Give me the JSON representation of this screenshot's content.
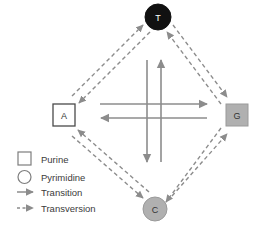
{
  "figure": {
    "background": "#ffffff"
  },
  "nodes": [
    {
      "id": "T",
      "label": "T",
      "shape": "circle",
      "class": "pyrimidine",
      "fill": "#111111",
      "stroke": "#111111",
      "text_color": "#ffffff",
      "position": "top"
    },
    {
      "id": "A",
      "label": "A",
      "shape": "square",
      "class": "purine",
      "fill": "#ffffff",
      "stroke": "#4a4a4a",
      "text_color": "#333333",
      "position": "left"
    },
    {
      "id": "G",
      "label": "G",
      "shape": "square",
      "class": "purine",
      "fill": "#b0b0b0",
      "stroke": "#9a9a9a",
      "text_color": "#333333",
      "position": "right"
    },
    {
      "id": "C",
      "label": "C",
      "shape": "circle",
      "class": "pyrimidine",
      "fill": "#b0b0b0",
      "stroke": "#9a9a9a",
      "text_color": "#333333",
      "position": "bottom"
    }
  ],
  "edges": {
    "transitions": [
      {
        "from": "A",
        "to": "G",
        "style": "solid",
        "orientation": "horizontal"
      },
      {
        "from": "G",
        "to": "A",
        "style": "solid",
        "orientation": "horizontal"
      },
      {
        "from": "T",
        "to": "C",
        "style": "solid",
        "orientation": "vertical"
      },
      {
        "from": "C",
        "to": "T",
        "style": "solid",
        "orientation": "vertical"
      }
    ],
    "transversions": [
      {
        "from": "A",
        "to": "T",
        "style": "dashed"
      },
      {
        "from": "T",
        "to": "A",
        "style": "dashed"
      },
      {
        "from": "T",
        "to": "G",
        "style": "dashed"
      },
      {
        "from": "G",
        "to": "T",
        "style": "dashed"
      },
      {
        "from": "A",
        "to": "C",
        "style": "dashed"
      },
      {
        "from": "C",
        "to": "A",
        "style": "dashed"
      },
      {
        "from": "C",
        "to": "G",
        "style": "dashed"
      },
      {
        "from": "G",
        "to": "C",
        "style": "dashed"
      }
    ]
  },
  "colors": {
    "arrow": "#8c8c8c",
    "node_dark": "#111111",
    "node_gray": "#b0b0b0",
    "node_white": "#ffffff",
    "text": "#3b3b3b",
    "legend_stroke": "#7d7d7d"
  },
  "legend": {
    "items": [
      {
        "symbol": "square",
        "label": "Purine"
      },
      {
        "symbol": "circle",
        "label": "Pyrimidine"
      },
      {
        "symbol": "solid-arrow",
        "label": "Transition"
      },
      {
        "symbol": "dashed-arrow",
        "label": "Transversion"
      }
    ]
  }
}
